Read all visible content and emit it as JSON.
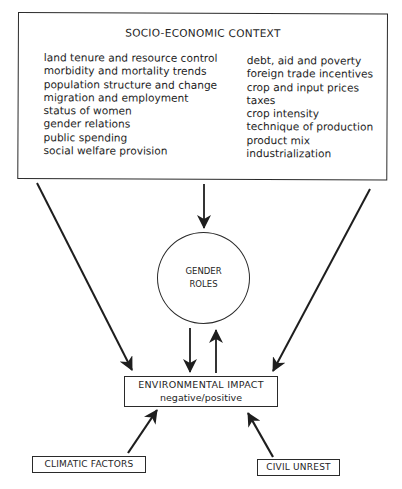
{
  "diagram": {
    "context_box": {
      "title": "SOCIO-ECONOMIC CONTEXT",
      "left_items": [
        "land tenure and resource control",
        "morbidity and mortality trends",
        "population structure and change",
        "migration and employment",
        "status of women",
        "gender relations",
        "public spending",
        "social welfare provision"
      ],
      "right_items": [
        "debt, aid and poverty",
        "foreign trade incentives",
        "crop and input prices",
        "taxes",
        "crop intensity",
        "technique of production",
        "product mix",
        "industrialization"
      ]
    },
    "gender_roles": {
      "line1": "GENDER",
      "line2": "ROLES"
    },
    "environmental_impact": {
      "line1": "ENVIRONMENTAL IMPACT",
      "line2": "negative/positive"
    },
    "climatic_factors": {
      "label": "CLIMATIC FACTORS"
    },
    "civil_unrest": {
      "label": "CIVIL UNREST"
    },
    "edges": [
      {
        "from": "SOCIO-ECONOMIC CONTEXT",
        "to": "GENDER ROLES"
      },
      {
        "from": "SOCIO-ECONOMIC CONTEXT",
        "to": "ENVIRONMENTAL IMPACT"
      },
      {
        "from": "SOCIO-ECONOMIC CONTEXT",
        "to": "ENVIRONMENTAL IMPACT"
      },
      {
        "from": "GENDER ROLES",
        "to": "ENVIRONMENTAL IMPACT"
      },
      {
        "from": "ENVIRONMENTAL IMPACT",
        "to": "GENDER ROLES"
      },
      {
        "from": "CLIMATIC FACTORS",
        "to": "ENVIRONMENTAL IMPACT"
      },
      {
        "from": "CIVIL UNREST",
        "to": "ENVIRONMENTAL IMPACT"
      }
    ],
    "colors": {
      "line": "#1e1e1e",
      "background": "#ffffff"
    }
  }
}
